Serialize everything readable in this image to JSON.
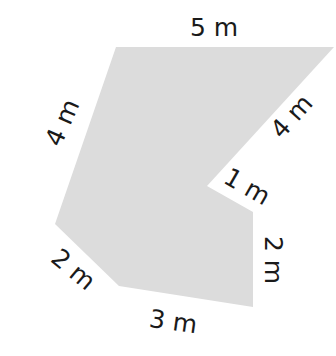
{
  "diagram": {
    "shape_fill": "#dcdcdc",
    "label_color": "#1a1a1a",
    "labels": {
      "top": "5 m",
      "upper_left": "4 m",
      "upper_right": "4 m",
      "notch": "1 m",
      "right": "2 m",
      "lower_left": "2 m",
      "bottom": "3 m"
    }
  }
}
